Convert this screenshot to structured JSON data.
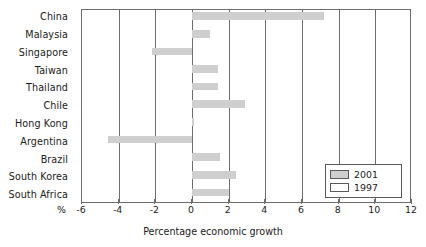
{
  "chart_data": {
    "type": "bar",
    "orientation": "horizontal",
    "title": "",
    "xlabel": "Percentage economic growth",
    "ylabel": "",
    "axis_unit_label": "%",
    "xlim": [
      -6,
      12
    ],
    "xticks": [
      -6,
      -4,
      -2,
      0,
      2,
      4,
      6,
      8,
      10,
      12
    ],
    "xtick_labels": [
      "-6",
      "-4",
      "-2",
      "0",
      "2",
      "4",
      "6",
      "8",
      "10",
      "12"
    ],
    "grid": true,
    "grid_axis": "x",
    "legend_position": "bottom-right",
    "categories": [
      "China",
      "Malaysia",
      "Singapore",
      "Taiwan",
      "Thailand",
      "Chile",
      "Hong Kong",
      "Argentina",
      "Brazil",
      "South Korea",
      "South Africa"
    ],
    "series": [
      {
        "name": "2001",
        "color": "#cfcfcf",
        "values": [
          7.2,
          1.0,
          -2.2,
          1.4,
          1.4,
          2.9,
          0.1,
          -4.6,
          1.5,
          2.4,
          2.0
        ]
      },
      {
        "name": "1997",
        "color": "#fbfbfb",
        "values": [
          0,
          0,
          0,
          0,
          0,
          0,
          0,
          0,
          0,
          0,
          0
        ]
      }
    ]
  },
  "legend": {
    "entries": [
      {
        "label": "2001",
        "swatch": "fill2001"
      },
      {
        "label": "1997",
        "swatch": "fill1997"
      }
    ]
  }
}
